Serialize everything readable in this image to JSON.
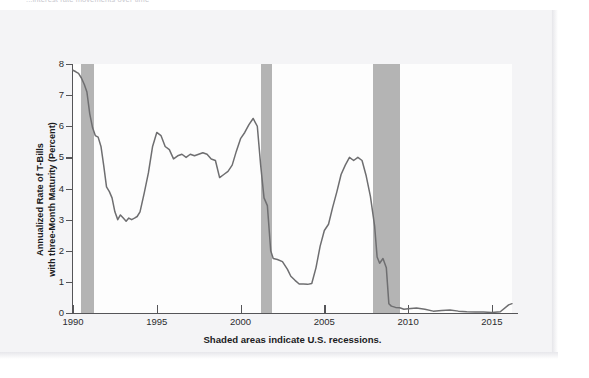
{
  "page": {
    "top_caption": "...interest rate movements over time"
  },
  "chart_data": {
    "type": "line",
    "title": "",
    "xlabel": "Shaded areas indicate U.S. recessions.",
    "ylabel": "Annualized Rate of T-Bills with three-Month Maturity (Percent)",
    "ylabel_line1": "Annualized Rate of T-Bills",
    "ylabel_line2": "with three-Month Maturity (Percent)",
    "xlim": [
      1990,
      2016.2
    ],
    "ylim": [
      0,
      8
    ],
    "xticks": [
      1990,
      1995,
      2000,
      2005,
      2010,
      2015
    ],
    "xtick_labels": [
      "1990",
      "1995",
      "2000",
      "2005",
      "2010",
      "2015"
    ],
    "yticks": [
      0,
      1,
      2,
      3,
      4,
      5,
      6,
      7,
      8
    ],
    "ytick_labels": [
      "0",
      "1",
      "2",
      "3",
      "4",
      "5",
      "6",
      "7",
      "8"
    ],
    "grid": false,
    "legend": "none",
    "line_color": "#6e6e70",
    "recession_color": "#b4b4b4",
    "axis_color": "#555558",
    "recessions": [
      {
        "start": 1990.5,
        "end": 1991.25,
        "label": "1990-91 recession"
      },
      {
        "start": 2001.2,
        "end": 2001.9,
        "label": "2001 recession"
      },
      {
        "start": 2007.9,
        "end": 2009.5,
        "label": "2007-09 recession"
      }
    ],
    "series": [
      {
        "name": "3-Month T-Bill Rate",
        "x": [
          1990.0,
          1990.17,
          1990.33,
          1990.5,
          1990.67,
          1990.83,
          1991.0,
          1991.17,
          1991.33,
          1991.5,
          1991.67,
          1991.83,
          1992.0,
          1992.17,
          1992.33,
          1992.5,
          1992.67,
          1992.83,
          1993.0,
          1993.17,
          1993.33,
          1993.5,
          1993.67,
          1993.83,
          1994.0,
          1994.25,
          1994.5,
          1994.75,
          1995.0,
          1995.25,
          1995.5,
          1995.75,
          1996.0,
          1996.25,
          1996.5,
          1996.75,
          1997.0,
          1997.25,
          1997.5,
          1997.75,
          1998.0,
          1998.25,
          1998.5,
          1998.75,
          1999.0,
          1999.25,
          1999.5,
          1999.75,
          2000.0,
          2000.25,
          2000.5,
          2000.75,
          2001.0,
          2001.2,
          2001.4,
          2001.6,
          2001.8,
          2001.95,
          2002.2,
          2002.5,
          2002.8,
          2003.0,
          2003.25,
          2003.5,
          2003.75,
          2004.0,
          2004.25,
          2004.5,
          2004.75,
          2005.0,
          2005.25,
          2005.5,
          2005.75,
          2006.0,
          2006.25,
          2006.5,
          2006.75,
          2007.0,
          2007.25,
          2007.5,
          2007.75,
          2008.0,
          2008.15,
          2008.3,
          2008.5,
          2008.7,
          2008.85,
          2009.0,
          2009.25,
          2009.5,
          2009.75,
          2010.0,
          2010.5,
          2011.0,
          2011.5,
          2012.0,
          2012.5,
          2013.0,
          2013.5,
          2014.0,
          2014.5,
          2015.0,
          2015.5,
          2016.0,
          2016.2
        ],
        "values": [
          7.8,
          7.75,
          7.7,
          7.55,
          7.35,
          7.1,
          6.4,
          5.95,
          5.7,
          5.65,
          5.35,
          4.75,
          4.05,
          3.9,
          3.7,
          3.25,
          3.0,
          3.15,
          3.05,
          2.95,
          3.05,
          3.0,
          3.05,
          3.1,
          3.25,
          3.85,
          4.5,
          5.35,
          5.8,
          5.7,
          5.35,
          5.25,
          4.95,
          5.05,
          5.1,
          5.0,
          5.1,
          5.05,
          5.1,
          5.15,
          5.1,
          4.95,
          4.9,
          4.35,
          4.45,
          4.55,
          4.75,
          5.2,
          5.6,
          5.8,
          6.05,
          6.25,
          6.0,
          4.75,
          3.7,
          3.45,
          2.0,
          1.75,
          1.72,
          1.65,
          1.4,
          1.18,
          1.05,
          0.93,
          0.93,
          0.92,
          0.95,
          1.45,
          2.15,
          2.65,
          2.85,
          3.4,
          3.9,
          4.45,
          4.75,
          5.0,
          4.9,
          5.0,
          4.9,
          4.4,
          3.75,
          2.8,
          1.8,
          1.6,
          1.75,
          1.45,
          0.3,
          0.22,
          0.18,
          0.17,
          0.12,
          0.14,
          0.16,
          0.12,
          0.06,
          0.08,
          0.1,
          0.06,
          0.04,
          0.03,
          0.03,
          0.02,
          0.04,
          0.26,
          0.3
        ],
        "units": "percent"
      }
    ]
  }
}
